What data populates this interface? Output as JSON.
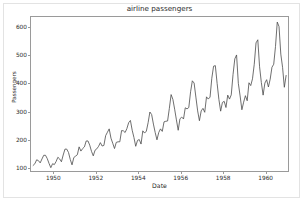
{
  "chart_data": {
    "type": "line",
    "title": "airline passengers",
    "xlabel": "Date",
    "ylabel": "Passengers",
    "grid": false,
    "legend": null,
    "line_color": "#4a4a4a",
    "line_width": 0.8,
    "xlim": [
      1948.9,
      1961.1
    ],
    "ylim": [
      85,
      640
    ],
    "yticks": [
      100,
      200,
      300,
      400,
      500,
      600
    ],
    "ytick_labels": [
      "100",
      "200",
      "300",
      "400",
      "500",
      "600"
    ],
    "xticks": [
      1950,
      1952,
      1954,
      1956,
      1958,
      1960
    ],
    "xtick_labels": [
      "1950",
      "1952",
      "1954",
      "1956",
      "1958",
      "1960"
    ],
    "x_start": 1949.0,
    "x_step": 0.0833333,
    "series": [
      {
        "name": "Passengers",
        "values": [
          112,
          118,
          132,
          129,
          121,
          135,
          148,
          148,
          136,
          119,
          104,
          118,
          115,
          126,
          141,
          135,
          125,
          149,
          170,
          170,
          158,
          133,
          114,
          140,
          145,
          150,
          178,
          163,
          172,
          178,
          199,
          199,
          184,
          162,
          146,
          166,
          171,
          180,
          193,
          181,
          183,
          218,
          230,
          242,
          209,
          191,
          172,
          194,
          196,
          196,
          236,
          235,
          229,
          243,
          264,
          272,
          237,
          211,
          180,
          201,
          204,
          188,
          235,
          227,
          234,
          264,
          302,
          293,
          259,
          229,
          203,
          229,
          242,
          233,
          267,
          269,
          270,
          315,
          364,
          347,
          312,
          274,
          237,
          278,
          284,
          277,
          317,
          313,
          318,
          374,
          413,
          405,
          355,
          306,
          271,
          306,
          315,
          301,
          356,
          348,
          355,
          422,
          465,
          467,
          404,
          347,
          305,
          336,
          340,
          318,
          362,
          348,
          363,
          435,
          491,
          505,
          404,
          359,
          310,
          337,
          360,
          342,
          406,
          396,
          420,
          472,
          548,
          559,
          463,
          407,
          362,
          405,
          417,
          391,
          419,
          461,
          472,
          535,
          622,
          606,
          508,
          461,
          390,
          432
        ]
      }
    ]
  },
  "colors": {
    "line": "#4a4a4a",
    "axes_frame": "#9a9a9a",
    "text": "#2b2b2b",
    "outer_border": "#e3e3e3",
    "background": "#ffffff"
  }
}
